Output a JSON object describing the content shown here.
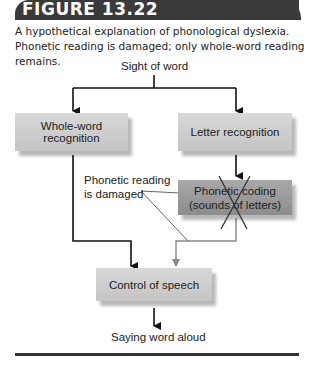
{
  "figure": {
    "label": "FIGURE 13.22",
    "caption": "A hypothetical explanation of phonological dyslexia. Phonetic reading is damaged; only whole-word reading remains."
  },
  "diagram": {
    "input": "Sight of word",
    "whole_word": "Whole-word recognition",
    "letter": "Letter recognition",
    "phonetic_line1": "Phonetic coding",
    "phonetic_line2": "(sounds of letters)",
    "annotation_line1": "Phonetic reading",
    "annotation_line2": "is damaged",
    "speech": "Control of speech",
    "output": "Saying word aloud"
  },
  "colors": {
    "header": "#3a3a3a",
    "light_box": "#cdcdcd",
    "dark_box": "#999999",
    "damaged_path": "#8a8a8a"
  }
}
